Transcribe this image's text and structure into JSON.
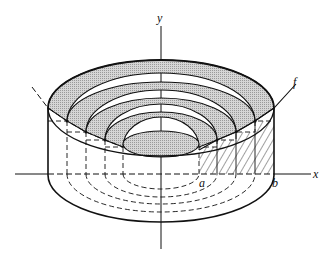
{
  "figure": {
    "labels": {
      "y_axis": "y",
      "x_axis": "x",
      "curve": "f",
      "a": "a",
      "b": "b"
    },
    "center_x": 161,
    "axis_y": 174,
    "shells": [
      {
        "rx": 112,
        "top_cy": 108,
        "top_ry": 48,
        "band_cy": 121,
        "band_ry": 48,
        "base_ry": 47
      },
      {
        "rx": 94,
        "top_cy": 121,
        "top_ry": 39,
        "band_cy": 132,
        "band_ry": 42,
        "base_ry": 38
      },
      {
        "rx": 75,
        "top_cy": 132,
        "top_ry": 34,
        "band_cy": 140,
        "band_ry": 36,
        "base_ry": 30
      },
      {
        "rx": 56,
        "top_cy": 140,
        "top_ry": 28,
        "band_cy": 147,
        "band_ry": 30,
        "base_ry": 23
      },
      {
        "rx": 38,
        "top_cy": 144,
        "top_ry": 13,
        "band_cy": 144,
        "band_ry": 13,
        "base_ry": 15
      }
    ],
    "colors": {
      "ink": "#111111",
      "shade": "#c8c8c8",
      "background": "#ffffff"
    }
  }
}
